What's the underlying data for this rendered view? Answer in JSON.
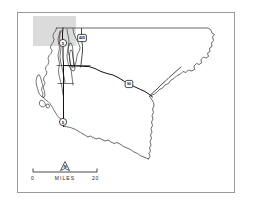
{
  "figure": {
    "type": "map",
    "region_name": "Puget Sound region county map",
    "background_color": "#ffffff",
    "frame_color": "#9a9a9a",
    "outline_color": "#2b2b2b",
    "highway_color": "#111111",
    "study_area_color": "#d9d9d9"
  },
  "frame": {
    "x": 17,
    "y": 12,
    "width": 218,
    "height": 181
  },
  "study_area": {
    "label": "shaded-study-area",
    "x": 33,
    "y": 16,
    "width": 43,
    "height": 30,
    "color": "#d9d9d9"
  },
  "highway_markers": [
    {
      "id": "marker-i5-north",
      "label": "5",
      "shape": "circle",
      "x": 63,
      "y": 43
    },
    {
      "id": "marker-405",
      "label": "405",
      "shape": "shield",
      "x": 82,
      "y": 38
    },
    {
      "id": "marker-i90",
      "label": "90",
      "shape": "shield",
      "x": 129,
      "y": 84
    },
    {
      "id": "marker-i5-south",
      "label": "5",
      "shape": "circle",
      "x": 63,
      "y": 122
    }
  ],
  "scale_bar": {
    "left_label": "0",
    "unit_label": "MILES",
    "right_label": "20",
    "min_value": 0,
    "max_value": 20,
    "units": "MILES",
    "x_start": 33,
    "x_end": 97,
    "y": 172
  },
  "north_arrow": {
    "letter": "N",
    "x": 65,
    "y": 166
  }
}
